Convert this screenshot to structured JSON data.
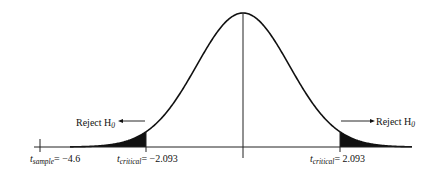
{
  "chart_data": {
    "type": "line",
    "title": "",
    "xlabel": "",
    "ylabel": "",
    "grid": false,
    "curve": "t-distribution density (bell shaped), centered at 0",
    "center_line": true,
    "markers": [
      {
        "name": "t_sample",
        "value": -4.6,
        "label_main": "t",
        "label_sub": "sample",
        "label_value": "= −4.6"
      },
      {
        "name": "t_critical_left",
        "value": -2.093,
        "label_main": "t",
        "label_sub": "critical",
        "label_value": "= −2.093"
      },
      {
        "name": "t_critical_right",
        "value": 2.093,
        "label_main": "t",
        "label_sub": "critical",
        "label_value": "= 2.093"
      }
    ],
    "shaded_regions": [
      {
        "from": "-inf",
        "to": -2.093,
        "label": "Reject H0"
      },
      {
        "from": 2.093,
        "to": "inf",
        "label": "Reject H0"
      }
    ],
    "annotations": [
      {
        "text": "Reject H",
        "sub": "0",
        "side": "left"
      },
      {
        "text": "Reject H",
        "sub": "0",
        "side": "right"
      }
    ]
  },
  "colors": {
    "curve": "#111111",
    "shade": "#111111",
    "axis": "#222222",
    "background": "#ffffff"
  }
}
